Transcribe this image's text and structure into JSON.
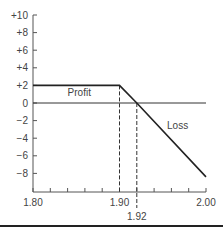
{
  "chart_data": {
    "type": "line",
    "title": "",
    "xlabel": "",
    "ylabel": "",
    "xlim": [
      1.8,
      2.0
    ],
    "ylim": [
      -10,
      10
    ],
    "grid": false,
    "legend": null,
    "x_ticks": [
      1.8,
      1.82,
      1.84,
      1.86,
      1.88,
      1.9,
      1.92,
      1.94,
      1.96,
      1.98,
      2.0
    ],
    "x_tick_labels": [
      {
        "value": 1.8,
        "label": "1.80"
      },
      {
        "value": 1.9,
        "label": "1.90"
      },
      {
        "value": 2.0,
        "label": "2.00"
      }
    ],
    "x_extra_label": {
      "value": 1.92,
      "label": "1.92"
    },
    "y_ticks": [
      {
        "value": 10,
        "label": "+10"
      },
      {
        "value": 8,
        "label": "+8"
      },
      {
        "value": 6,
        "label": "+6"
      },
      {
        "value": 4,
        "label": "+4"
      },
      {
        "value": 2,
        "label": "+2"
      },
      {
        "value": 0,
        "label": "0"
      },
      {
        "value": -2,
        "label": "−2"
      },
      {
        "value": -4,
        "label": "−4"
      },
      {
        "value": -6,
        "label": "−6"
      },
      {
        "value": -8,
        "label": "−8"
      }
    ],
    "series": [
      {
        "name": "Payoff",
        "x": [
          1.8,
          1.9,
          1.92,
          2.0
        ],
        "y": [
          2,
          2,
          0,
          -8.4
        ]
      }
    ],
    "reference_lines": [
      {
        "type": "horizontal",
        "y": 0,
        "style": "solid"
      },
      {
        "type": "vertical",
        "x": 1.9,
        "style": "dashed",
        "from_y": -10,
        "to_y": 2
      },
      {
        "type": "vertical",
        "x": 1.92,
        "style": "dashed",
        "from_y": -10.8,
        "to_y": 0
      }
    ],
    "annotations": [
      {
        "text": "Profit",
        "x": 1.84,
        "y": 0.8
      },
      {
        "text": "Loss",
        "x": 1.955,
        "y": -3
      }
    ]
  }
}
